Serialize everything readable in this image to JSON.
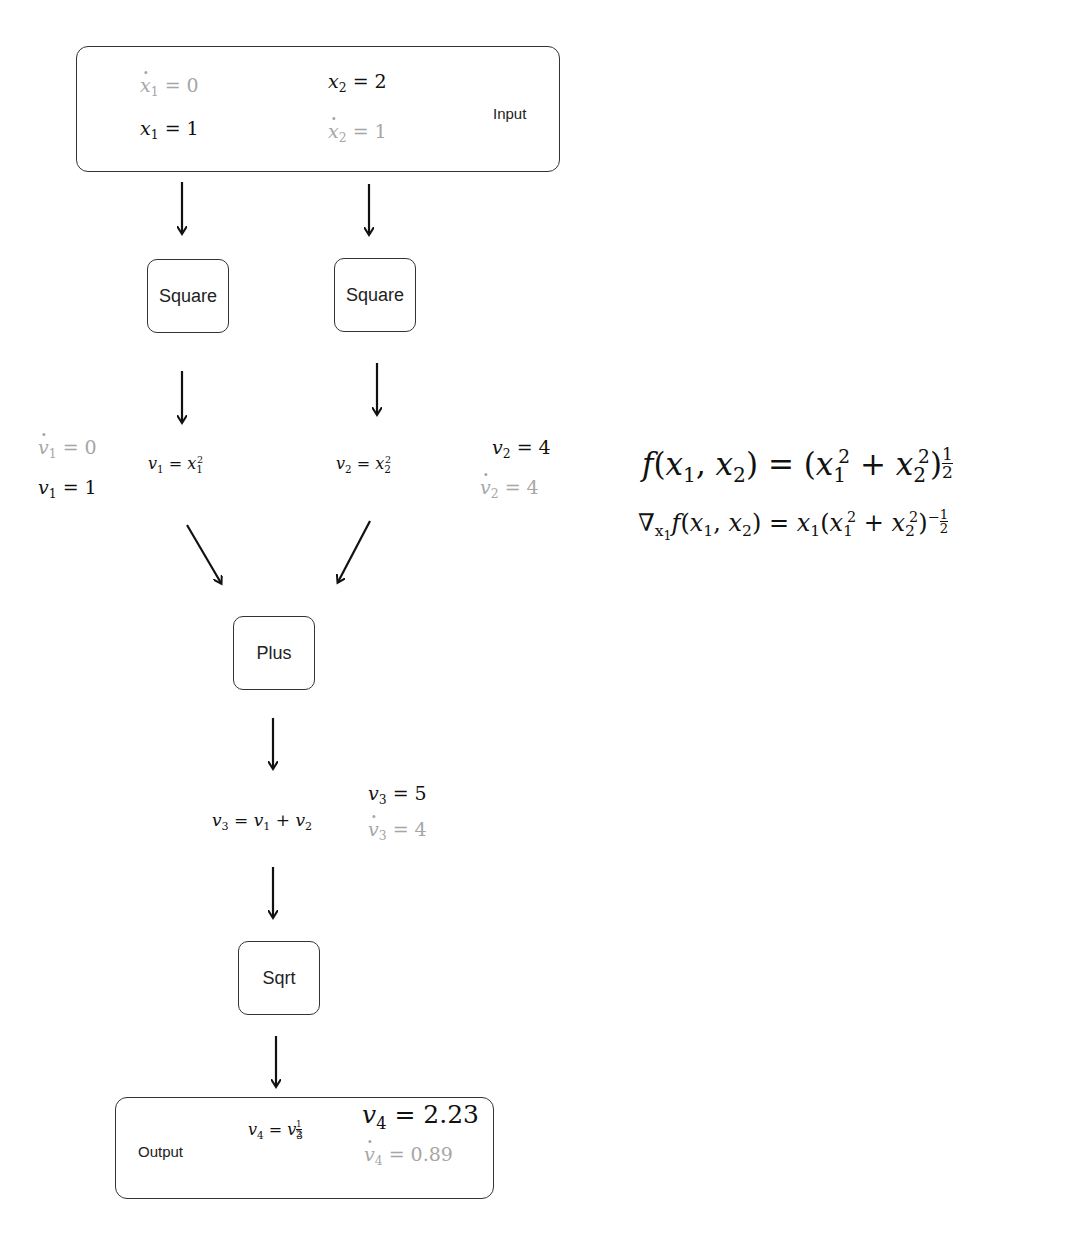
{
  "input": {
    "label": "Input",
    "x1_dot": {
      "var": "x",
      "sub": "1",
      "value": "0"
    },
    "x1": {
      "var": "x",
      "sub": "1",
      "value": "1"
    },
    "x2": {
      "var": "x",
      "sub": "2",
      "value": "2"
    },
    "x2_dot": {
      "var": "x",
      "sub": "2",
      "value": "1"
    }
  },
  "nodes": {
    "square1": "Square",
    "square2": "Square",
    "plus": "Plus",
    "sqrt": "Sqrt"
  },
  "v1": {
    "dot_value": "0",
    "value": "1",
    "formula_lhs": "v",
    "formula_lhs_sub": "1",
    "formula_rhs": "x",
    "formula_rhs_sub": "1",
    "formula_rhs_sup": "2"
  },
  "v2": {
    "dot_value": "4",
    "value": "4",
    "formula_lhs": "v",
    "formula_lhs_sub": "2",
    "formula_rhs": "x",
    "formula_rhs_sub": "2",
    "formula_rhs_sup": "2"
  },
  "v3": {
    "value": "5",
    "dot_value": "4",
    "formula": "v3 = v1 + v2"
  },
  "output": {
    "label": "Output",
    "formula": "v4 = v3^(1/2)",
    "value": "2.23",
    "dot_value": "0.89"
  },
  "equations": {
    "f": "f(x1, x2) = (x1^2 + x2^2)^(1/2)",
    "grad": "∇x1 f(x1, x2) = x1(x1^2 + x2^2)^(-1/2)"
  },
  "colors": {
    "primal": "#111111",
    "tangent": "#a6a6a6",
    "border": "#333333"
  }
}
